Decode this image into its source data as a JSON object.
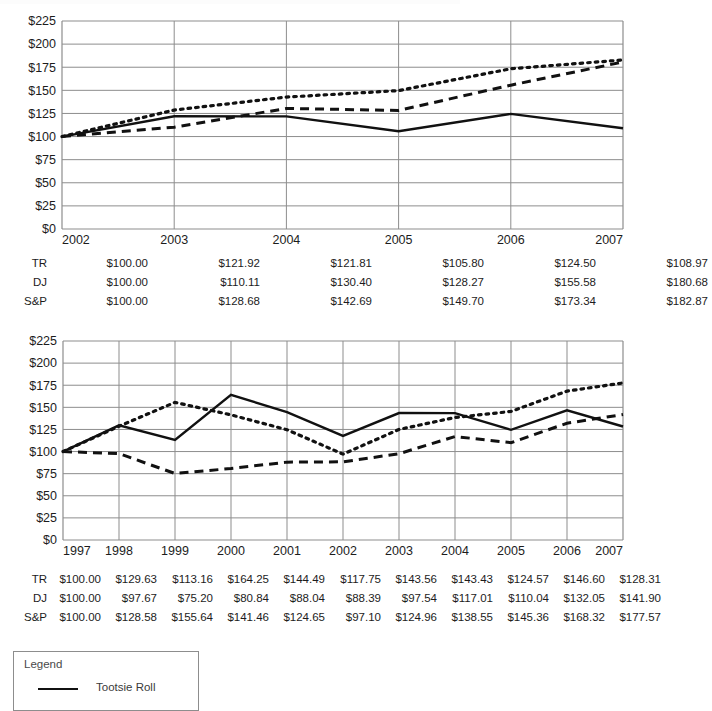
{
  "page": {
    "background_color": "#ffffff",
    "axis_color": "#8d8d8d",
    "line_color": "#111111"
  },
  "chart_data": [
    {
      "id": "chart-5-year",
      "type": "line",
      "title": "",
      "xlabel": "",
      "ylabel": "",
      "ylim": [
        0,
        225
      ],
      "ytick_labels": [
        "$225",
        "$200",
        "$175",
        "$150",
        "$125",
        "$100",
        "$75",
        "$50",
        "$25",
        "$0"
      ],
      "ytick_values": [
        225,
        200,
        175,
        150,
        125,
        100,
        75,
        50,
        25,
        0
      ],
      "grid": true,
      "legend_position": "external-bottom",
      "categories": [
        "2002",
        "2003",
        "2004",
        "2005",
        "2006",
        "2007"
      ],
      "series": [
        {
          "name": "TR",
          "label": "Tootsie Roll",
          "style": "solid",
          "values": [
            100.0,
            121.92,
            121.81,
            105.8,
            124.5,
            108.97
          ]
        },
        {
          "name": "DJ",
          "label": "DJ",
          "style": "dashed",
          "values": [
            100.0,
            110.11,
            130.4,
            128.27,
            155.58,
            180.68
          ]
        },
        {
          "name": "S&P",
          "label": "S&P",
          "style": "dotted",
          "values": [
            100.0,
            128.68,
            142.69,
            149.7,
            173.34,
            182.87
          ]
        }
      ]
    },
    {
      "id": "chart-10-year",
      "type": "line",
      "title": "",
      "xlabel": "",
      "ylabel": "",
      "ylim": [
        0,
        225
      ],
      "ytick_labels": [
        "$225",
        "$200",
        "$175",
        "$150",
        "$125",
        "$100",
        "$75",
        "$50",
        "$25",
        "$0"
      ],
      "ytick_values": [
        225,
        200,
        175,
        150,
        125,
        100,
        75,
        50,
        25,
        0
      ],
      "grid": true,
      "legend_position": "external-bottom",
      "categories": [
        "1997",
        "1998",
        "1999",
        "2000",
        "2001",
        "2002",
        "2003",
        "2004",
        "2005",
        "2006",
        "2007"
      ],
      "series": [
        {
          "name": "TR",
          "label": "Tootsie Roll",
          "style": "solid",
          "values": [
            100.0,
            129.63,
            113.16,
            164.25,
            144.49,
            117.75,
            143.56,
            143.43,
            124.57,
            146.6,
            128.31
          ]
        },
        {
          "name": "DJ",
          "label": "DJ",
          "style": "dashed",
          "values": [
            100.0,
            97.67,
            75.2,
            80.84,
            88.04,
            88.39,
            97.54,
            117.01,
            110.04,
            132.05,
            141.9
          ]
        },
        {
          "name": "S&P",
          "label": "S&P",
          "style": "dotted",
          "values": [
            100.0,
            128.58,
            155.64,
            141.46,
            124.65,
            97.1,
            124.96,
            138.55,
            145.36,
            168.32,
            177.57
          ]
        }
      ]
    }
  ],
  "table1": {
    "rows": [
      {
        "label": "TR",
        "values": [
          "$100.00",
          "$121.92",
          "$121.81",
          "$105.80",
          "$124.50",
          "$108.97"
        ]
      },
      {
        "label": "DJ",
        "values": [
          "$100.00",
          "$110.11",
          "$130.40",
          "$128.27",
          "$155.58",
          "$180.68"
        ]
      },
      {
        "label": "S&P",
        "values": [
          "$100.00",
          "$128.68",
          "$142.69",
          "$149.70",
          "$173.34",
          "$182.87"
        ]
      }
    ]
  },
  "table2": {
    "rows": [
      {
        "label": "TR",
        "values": [
          "$100.00",
          "$129.63",
          "$113.16",
          "$164.25",
          "$144.49",
          "$117.75",
          "$143.56",
          "$143.43",
          "$124.57",
          "$146.60",
          "$128.31"
        ]
      },
      {
        "label": "DJ",
        "values": [
          "$100.00",
          "$97.67",
          "$75.20",
          "$80.84",
          "$88.04",
          "$88.39",
          "$97.54",
          "$117.01",
          "$110.04",
          "$132.05",
          "$141.90"
        ]
      },
      {
        "label": "S&P",
        "values": [
          "$100.00",
          "$128.58",
          "$155.64",
          "$141.46",
          "$124.65",
          "$97.10",
          "$124.96",
          "$138.55",
          "$145.36",
          "$168.32",
          "$177.57"
        ]
      }
    ]
  },
  "legend": {
    "title": "Legend",
    "entries": [
      {
        "label": "Tootsie Roll",
        "style": "solid"
      }
    ]
  }
}
